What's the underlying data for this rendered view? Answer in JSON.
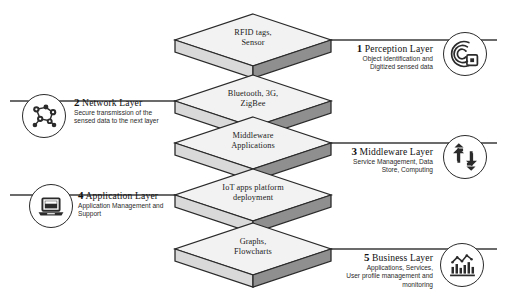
{
  "diagram": {
    "background_color": "#ffffff",
    "slab_top_color": "#f2f2f2",
    "slab_left_color": "#d9d9d9",
    "slab_right_color": "#8f8f8f",
    "outline_color": "#2b2b2b",
    "connector_color": "#3a3a3a"
  },
  "slabs": [
    {
      "label": "RFID tags,\nSensor"
    },
    {
      "label": "Bluetooth, 3G,\nZigBee"
    },
    {
      "label": "Middleware\nApplications"
    },
    {
      "label": "IoT apps platform\ndeployment"
    },
    {
      "label": "Graphs,\nFlowcharts"
    }
  ],
  "layers": [
    {
      "number": "1",
      "name": "Perception Layer",
      "description": "Object identification and\nDigitized sensed data",
      "side": "right",
      "icon": "rfid-signal-icon"
    },
    {
      "number": "2",
      "name": "Network Layer",
      "description": "Secure transmission of the\nsensed data to the next layer",
      "side": "left",
      "icon": "network-nodes-icon"
    },
    {
      "number": "3",
      "name": "Middleware Layer",
      "description": "Service Management, Data\nStore, Computing",
      "side": "right",
      "icon": "cycle-arrows-icon"
    },
    {
      "number": "4",
      "name": "Application Layer",
      "description": "Application Management and\nSupport",
      "side": "left",
      "icon": "laptop-icon"
    },
    {
      "number": "5",
      "name": "Business Layer",
      "description": "Applications, Services,\nUser profile management and\nmonitoring",
      "side": "right",
      "icon": "bar-chart-icon"
    }
  ]
}
